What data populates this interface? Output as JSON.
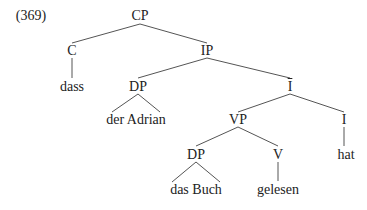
{
  "example_number": "(369)",
  "nodes": {
    "cp": {
      "label": "CP",
      "x": 140,
      "y": 16
    },
    "c": {
      "label": "C",
      "x": 72,
      "y": 51
    },
    "dass": {
      "label": "dass",
      "x": 72,
      "y": 87
    },
    "ip": {
      "label": "IP",
      "x": 207,
      "y": 51
    },
    "dp1": {
      "label": "DP",
      "x": 138,
      "y": 87
    },
    "der_adrian": {
      "label": "der Adrian",
      "x": 136,
      "y": 120
    },
    "ibar": {
      "label": "I",
      "x": 290,
      "y": 87
    },
    "vp": {
      "label": "VP",
      "x": 238,
      "y": 120
    },
    "i": {
      "label": "I",
      "x": 344,
      "y": 120
    },
    "hat": {
      "label": "hat",
      "x": 346,
      "y": 155
    },
    "dp2": {
      "label": "DP",
      "x": 196,
      "y": 155
    },
    "das_buch": {
      "label": "das Buch",
      "x": 196,
      "y": 190
    },
    "v": {
      "label": "V",
      "x": 278,
      "y": 155
    },
    "gelesen": {
      "label": "gelesen",
      "x": 278,
      "y": 190
    }
  },
  "edges": [
    [
      140,
      24,
      72,
      43
    ],
    [
      140,
      24,
      207,
      43
    ],
    [
      72,
      58,
      72,
      78
    ],
    [
      207,
      58,
      138,
      78
    ],
    [
      207,
      58,
      290,
      78
    ],
    [
      138,
      94,
      112,
      112
    ],
    [
      138,
      94,
      160,
      112
    ],
    [
      290,
      94,
      238,
      112
    ],
    [
      290,
      94,
      344,
      112
    ],
    [
      344,
      127,
      344,
      146
    ],
    [
      238,
      127,
      196,
      146
    ],
    [
      238,
      127,
      278,
      146
    ],
    [
      196,
      162,
      172,
      182
    ],
    [
      196,
      162,
      220,
      182
    ],
    [
      278,
      162,
      278,
      181
    ]
  ]
}
